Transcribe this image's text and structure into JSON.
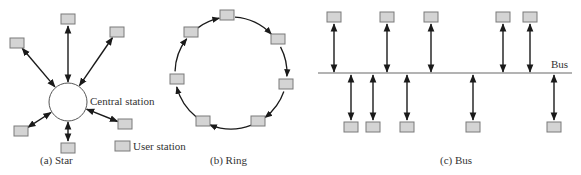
{
  "figure": {
    "captions": {
      "star": "(a) Star",
      "ring": "(b) Ring",
      "bus": "(c) Bus"
    },
    "labels": {
      "central_station": "Central station",
      "bus": "Bus",
      "legend_user_station": "User station"
    },
    "colors": {
      "station_fill": "#d4d4d4",
      "station_stroke": "#7a7a7a",
      "link": "#1a1a1a",
      "bus_line": "#9a9a9a"
    }
  },
  "star": {
    "hub": {
      "cx": 68,
      "cy": 102,
      "r": 19
    },
    "stations": [
      {
        "x": 68,
        "y": 19
      },
      {
        "x": 117,
        "y": 32
      },
      {
        "x": 17,
        "y": 43
      },
      {
        "x": 125,
        "y": 124
      },
      {
        "x": 21,
        "y": 131
      },
      {
        "x": 68,
        "y": 148
      }
    ]
  },
  "ring": {
    "center": {
      "cx": 231,
      "cy": 73
    },
    "radius": 56,
    "stations": [
      {
        "x": 227,
        "y": 15
      },
      {
        "x": 278,
        "y": 39
      },
      {
        "x": 286,
        "y": 84
      },
      {
        "x": 258,
        "y": 121
      },
      {
        "x": 203,
        "y": 121
      },
      {
        "x": 177,
        "y": 79
      },
      {
        "x": 191,
        "y": 32
      }
    ],
    "direction": "clockwise"
  },
  "bus": {
    "line": {
      "x1": 318,
      "x2": 572,
      "y": 73
    },
    "top_stations": [
      334,
      387,
      431,
      503,
      530
    ],
    "bottom_stations": [
      351,
      373,
      407,
      473,
      554
    ],
    "top_y": 17,
    "bottom_y": 127
  },
  "legend": {
    "box": {
      "x": 115,
      "y": 141
    }
  }
}
